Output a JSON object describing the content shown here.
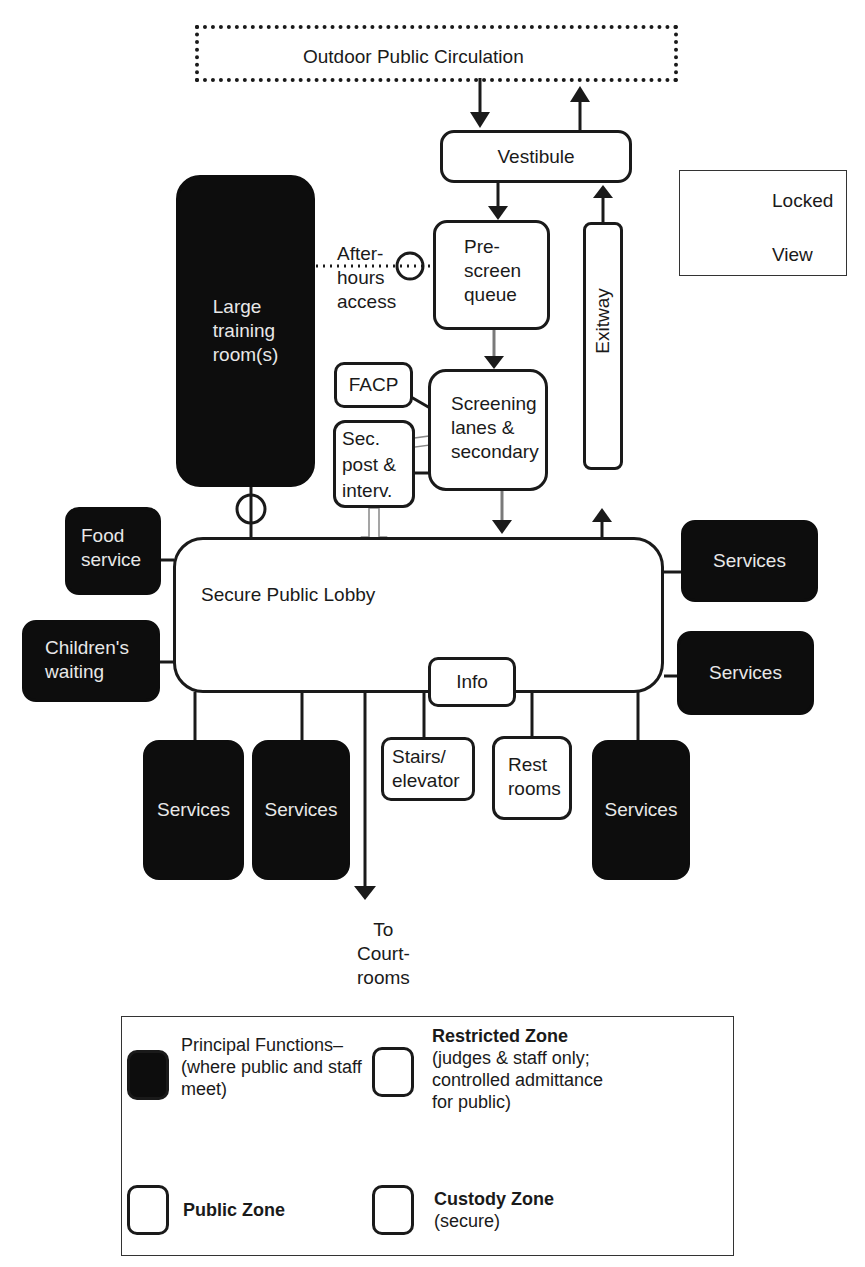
{
  "diagram": {
    "type": "courthouse public zone circulation diagram",
    "nodes": {
      "outdoor": "Outdoor Public Circulation",
      "vestibule": "Vestibule",
      "prescreen": "Pre-\nscreen\nqueue",
      "exitway": "Exitway",
      "training": "Large\ntraining\nroom(s)",
      "after_hours": "After-\nhours\naccess",
      "facp": "FACP",
      "sec_post": "Sec.\npost &\ninterv.",
      "screening": "Screening\nlanes &\nsecondary",
      "lobby": "Secure Public Lobby",
      "food": "Food\nservice",
      "children": "Children's\nwaiting",
      "services_right_top": "Services",
      "services_right_mid": "Services",
      "services_bottom_1": "Services",
      "services_bottom_2": "Services",
      "services_bottom_3": "Services",
      "info": "Info",
      "stairs": "Stairs/\nelevator",
      "restrooms": "Rest\nrooms",
      "to_courtrooms": "To\nCourt-\nrooms"
    },
    "symbol_legend": {
      "locked": "Locked",
      "view": "View"
    },
    "zone_legend": {
      "principal_title": "Principal Functions–",
      "principal_desc": "(where public and staff\nmeet)",
      "restricted_title": "Restricted Zone",
      "restricted_desc": "(judges & staff only;\ncontrolled admittance\nfor public)",
      "public_title": "Public Zone",
      "custody_title": "Custody Zone",
      "custody_desc": "(secure)"
    },
    "colors": {
      "ink": "#1a1a1a",
      "principal_fill": "#0d0d0d",
      "gray_arrow": "#7a7a7a",
      "background": "#ffffff"
    }
  }
}
